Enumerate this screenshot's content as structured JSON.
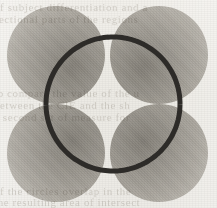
{
  "figure": {
    "width": 217,
    "height": 208,
    "background_color": "#eceae5",
    "paper_tone": "off-white scanned page"
  },
  "chart_data": {
    "type": "scatter",
    "title": "",
    "xlabel": "",
    "ylabel": "",
    "xlim": [
      0,
      217
    ],
    "ylim": [
      0,
      208
    ],
    "grid": false,
    "legend": "none",
    "shapes": [
      {
        "name": "disc-top-left",
        "kind": "circle",
        "cx": 56,
        "cy": 55,
        "r": 49,
        "fill": "#a8a5a0",
        "shading": "radial",
        "dark_point": [
          66,
          62
        ],
        "dark_color": "#8d8a85",
        "light_color": "#d8d5d0"
      },
      {
        "name": "disc-top-right",
        "kind": "circle",
        "cx": 159,
        "cy": 55,
        "r": 49,
        "fill": "#a8a5a0",
        "shading": "radial",
        "dark_point": [
          34,
          62
        ],
        "dark_color": "#8d8a85",
        "light_color": "#d8d5d0"
      },
      {
        "name": "disc-bottom-left",
        "kind": "circle",
        "cx": 56,
        "cy": 153,
        "r": 49,
        "fill": "#a8a5a0",
        "shading": "radial",
        "dark_point": [
          66,
          38
        ],
        "dark_color": "#8d8a85",
        "light_color": "#d8d5d0"
      },
      {
        "name": "disc-bottom-right",
        "kind": "circle",
        "cx": 159,
        "cy": 153,
        "r": 49,
        "fill": "#a8a5a0",
        "shading": "radial",
        "dark_point": [
          34,
          38
        ],
        "dark_color": "#8d8a85",
        "light_color": "#d8d5d0"
      },
      {
        "name": "dotted-overlay-circle",
        "kind": "circle",
        "cx": 113,
        "cy": 104,
        "r": 67,
        "fill": "none",
        "stroke": "#2e2c29",
        "stroke_width": 5,
        "dash": "4.6 4.6"
      }
    ]
  },
  "ghost_text": {
    "row1": "of  subject  differentiation  and  a",
    "row2": "sectional  parts  of  the  regions",
    "row3": "to  compare  the  value  of  the  u",
    "row4": "between  the  CIE  and  the  sh",
    "row5": "a  second  set  of  measure  for",
    "row6": "of  the  circles  overlap  in  the",
    "row7": "the  resulting  area  of  intersect"
  }
}
